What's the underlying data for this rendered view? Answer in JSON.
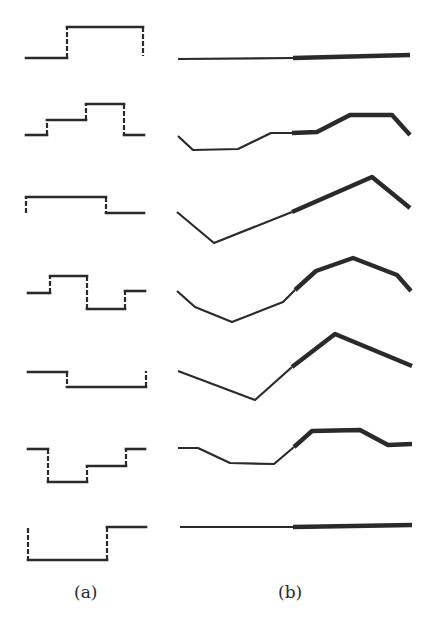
{
  "figure": {
    "stroke_color": "#2a2a2a",
    "background": "#ffffff",
    "labels": {
      "a": "(a)",
      "b": "(b)"
    },
    "panel_a": {
      "description": "step waveforms with dashed vertical transitions",
      "rows": [
        {
          "solid": [
            [
              [
                26,
                58
              ],
              [
                67,
                58
              ]
            ],
            [
              [
                67,
                27
              ],
              [
                143,
                27
              ]
            ]
          ],
          "dashed": [
            [
              [
                67,
                58
              ],
              [
                67,
                27
              ]
            ],
            [
              [
                143,
                27
              ],
              [
                143,
                56
              ]
            ]
          ]
        },
        {
          "solid": [
            [
              [
                26,
                135
              ],
              [
                47,
                135
              ]
            ],
            [
              [
                47,
                120
              ],
              [
                86,
                120
              ]
            ],
            [
              [
                86,
                104
              ],
              [
                124,
                104
              ]
            ],
            [
              [
                124,
                135
              ],
              [
                144,
                135
              ]
            ]
          ],
          "dashed": [
            [
              [
                47,
                135
              ],
              [
                47,
                120
              ]
            ],
            [
              [
                86,
                120
              ],
              [
                86,
                104
              ]
            ],
            [
              [
                124,
                104
              ],
              [
                124,
                135
              ]
            ]
          ]
        },
        {
          "solid": [
            [
              [
                26,
                197
              ],
              [
                106,
                197
              ]
            ],
            [
              [
                106,
                213
              ],
              [
                144,
                213
              ]
            ]
          ],
          "dashed": [
            [
              [
                26,
                213
              ],
              [
                26,
                197
              ]
            ],
            [
              [
                106,
                197
              ],
              [
                106,
                213
              ]
            ]
          ]
        },
        {
          "solid": [
            [
              [
                28,
                293
              ],
              [
                50,
                293
              ]
            ],
            [
              [
                50,
                276
              ],
              [
                87,
                276
              ]
            ],
            [
              [
                87,
                309
              ],
              [
                125,
                309
              ]
            ],
            [
              [
                125,
                291
              ],
              [
                145,
                291
              ]
            ]
          ],
          "dashed": [
            [
              [
                50,
                293
              ],
              [
                50,
                276
              ]
            ],
            [
              [
                87,
                276
              ],
              [
                87,
                309
              ]
            ],
            [
              [
                125,
                309
              ],
              [
                125,
                291
              ]
            ]
          ]
        },
        {
          "solid": [
            [
              [
                28,
                372
              ],
              [
                67,
                372
              ]
            ],
            [
              [
                67,
                387
              ],
              [
                146,
                387
              ]
            ]
          ],
          "dashed": [
            [
              [
                67,
                372
              ],
              [
                67,
                387
              ]
            ],
            [
              [
                146,
                387
              ],
              [
                146,
                371
              ]
            ]
          ]
        },
        {
          "solid": [
            [
              [
                28,
                449
              ],
              [
                48,
                449
              ]
            ],
            [
              [
                48,
                482
              ],
              [
                87,
                482
              ]
            ],
            [
              [
                87,
                466
              ],
              [
                126,
                466
              ]
            ],
            [
              [
                126,
                449
              ],
              [
                145,
                449
              ]
            ]
          ],
          "dashed": [
            [
              [
                48,
                449
              ],
              [
                48,
                482
              ]
            ],
            [
              [
                87,
                482
              ],
              [
                87,
                466
              ]
            ],
            [
              [
                126,
                466
              ],
              [
                126,
                449
              ]
            ]
          ]
        },
        {
          "solid": [
            [
              [
                28,
                560
              ],
              [
                107,
                560
              ]
            ],
            [
              [
                107,
                527
              ],
              [
                146,
                527
              ]
            ]
          ],
          "dashed": [
            [
              [
                28,
                528
              ],
              [
                28,
                560
              ]
            ],
            [
              [
                107,
                560
              ],
              [
                107,
                527
              ]
            ]
          ]
        }
      ]
    },
    "panel_b": {
      "description": "piecewise-linear curves, thin left half and thick right half",
      "rows": [
        {
          "thin": [
            [
              178,
              59
            ],
            [
              293,
              58
            ]
          ],
          "thick": [
            [
              293,
              58
            ],
            [
              410,
              55
            ]
          ]
        },
        {
          "thin": [
            [
              178,
              136
            ],
            [
              193,
              150
            ],
            [
              238,
              149
            ],
            [
              271,
              133
            ],
            [
              292,
              133
            ]
          ],
          "thick": [
            [
              292,
              133
            ],
            [
              317,
              132
            ],
            [
              350,
              115
            ],
            [
              392,
              115
            ],
            [
              410,
              135
            ]
          ]
        },
        {
          "thin": [
            [
              177,
              212
            ],
            [
              214,
              243
            ],
            [
              292,
              212
            ]
          ],
          "thick": [
            [
              292,
              212
            ],
            [
              372,
              177
            ],
            [
              410,
              208
            ]
          ]
        },
        {
          "thin": [
            [
              177,
              291
            ],
            [
              195,
              307
            ],
            [
              232,
              322
            ],
            [
              283,
              302
            ],
            [
              295,
              290
            ]
          ],
          "thick": [
            [
              295,
              290
            ],
            [
              316,
              271
            ],
            [
              353,
              258
            ],
            [
              397,
              275
            ],
            [
              411,
              291
            ]
          ]
        },
        {
          "thin": [
            [
              178,
              371
            ],
            [
              255,
              400
            ],
            [
              292,
              367
            ]
          ],
          "thick": [
            [
              292,
              367
            ],
            [
              335,
              334
            ],
            [
              412,
              366
            ]
          ]
        },
        {
          "thin": [
            [
              178,
              448
            ],
            [
              198,
              448
            ],
            [
              230,
              463
            ],
            [
              274,
              464
            ],
            [
              294,
              447
            ]
          ],
          "thick": [
            [
              294,
              447
            ],
            [
              312,
              431
            ],
            [
              360,
              430
            ],
            [
              388,
              445
            ],
            [
              412,
              444
            ]
          ]
        },
        {
          "thin": [
            [
              180,
              527
            ],
            [
              293,
              527
            ]
          ],
          "thick": [
            [
              293,
              527
            ],
            [
              412,
              525
            ]
          ]
        }
      ]
    }
  }
}
